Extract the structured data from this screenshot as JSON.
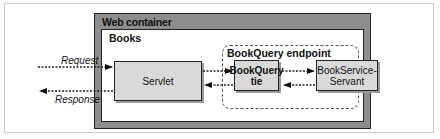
{
  "diagram": {
    "containers": {
      "web_container": "Web container",
      "books": "Books",
      "endpoint": "BookQuery endpoint"
    },
    "components": {
      "servlet": "Servlet",
      "tie_line1": "BookQuery",
      "tie_line2": "tie",
      "servant_line1": "BookService-",
      "servant_line2": "Servant"
    },
    "flows": {
      "request": "Request",
      "response": "Response"
    },
    "colors": {
      "container_fill": "#8e8e8e",
      "box_fill": "#d9d9d9",
      "border": "#222222"
    }
  }
}
